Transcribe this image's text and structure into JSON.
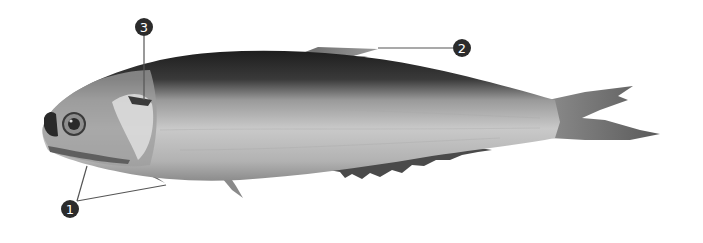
{
  "figure": {
    "background_color": "#ffffff",
    "marker_color": "#2b2b2b",
    "leader_line_color": "#555555"
  },
  "markers": [
    {
      "id": "marker-1",
      "label": "1",
      "target": "pelvic fins / lower jaw"
    },
    {
      "id": "marker-2",
      "label": "2",
      "target": "dorsal fin"
    },
    {
      "id": "marker-3",
      "label": "3",
      "target": "opercle / gill cover"
    }
  ]
}
